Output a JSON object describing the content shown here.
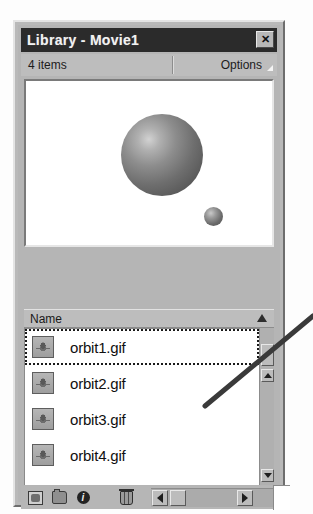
{
  "window": {
    "title": "Library - Movie1",
    "close_label": "✕"
  },
  "infobar": {
    "item_count": "4 items",
    "options_label": "Options"
  },
  "preview": {
    "large_sphere_name": "orbit-large-sphere",
    "small_sphere_name": "orbit-small-sphere"
  },
  "list": {
    "column_header": "Name",
    "items": [
      {
        "name": "orbit1.gif",
        "selected": true
      },
      {
        "name": "orbit2.gif",
        "selected": false
      },
      {
        "name": "orbit3.gif",
        "selected": false
      },
      {
        "name": "orbit4.gif",
        "selected": false
      }
    ]
  },
  "toolbar": {
    "properties_glyph": "i"
  },
  "colors": {
    "window_face": "#b5b5b5",
    "titlebar": "#2b2b2b",
    "titlebar_text": "#f2f2f2",
    "preview_background": "#ffffff",
    "list_background": "#ffffff",
    "text": "#101010",
    "annotation_line": "#3a3a3a"
  }
}
